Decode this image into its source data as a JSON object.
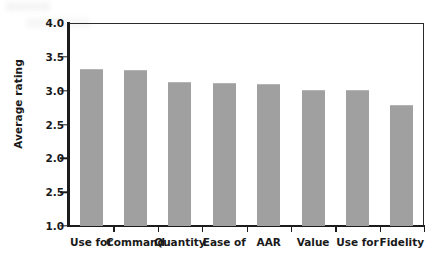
{
  "chart_data": {
    "type": "bar",
    "title": "",
    "xlabel": "",
    "ylabel": "Average rating",
    "categories": [
      "Use for",
      "Command",
      "Quantity",
      "Ease of",
      "AAR",
      "Value",
      "Use for",
      "Fidelity"
    ],
    "values": [
      3.3,
      3.29,
      3.12,
      3.1,
      3.08,
      3.0,
      2.99,
      2.77
    ],
    "ylim": [
      1.0,
      4.0
    ],
    "ytick_labels": [
      "4.0",
      "3.5",
      "3.0",
      "2.5",
      "2.0",
      "2.5",
      "1.0"
    ],
    "ytick_values": [
      4.0,
      3.5,
      3.0,
      2.5,
      2.0,
      1.5,
      1.0
    ],
    "grid": false,
    "legend": false,
    "bar_color": "#a0a0a0",
    "axis_color": "#1c1c1c",
    "text_color": "#1a1a1a"
  },
  "axis": {
    "y_title": "Average rating"
  }
}
